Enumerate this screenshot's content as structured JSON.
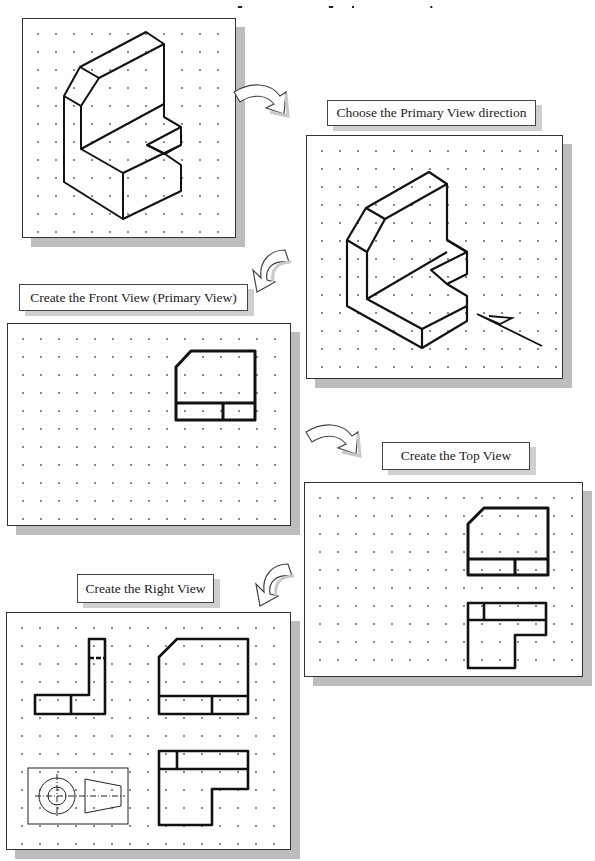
{
  "page": {
    "title_visible_fragment": "g   g p   y",
    "background": "#ffffff"
  },
  "steps": [
    {
      "id": "isometric",
      "label": "",
      "description": "Isometric pictorial of L-bracket part with notch and chamfered top"
    },
    {
      "id": "primary-direction",
      "label": "Choose the Primary View direction"
    },
    {
      "id": "front-view",
      "label": "Create the Front View (Primary View)"
    },
    {
      "id": "top-view",
      "label": "Create the Top View"
    },
    {
      "id": "right-view",
      "label": "Create the Right View"
    }
  ],
  "labels": {
    "choose_primary": "Choose the Primary View direction",
    "front_view": "Create the Front View (Primary View)",
    "top_view": "Create the Top View",
    "right_view": "Create the Right View"
  },
  "colors": {
    "line": "#111111",
    "panel_border": "#333333",
    "shadow": "#bdbdbd",
    "grid_dot": "#8a8a8a"
  },
  "icons": [
    "curved-arrow-right",
    "curved-arrow-down-left",
    "curved-arrow-right",
    "curved-arrow-down-left",
    "projection-symbol"
  ]
}
